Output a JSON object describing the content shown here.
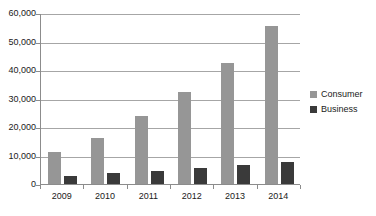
{
  "chart_data": {
    "type": "bar",
    "title": "",
    "subtitle": "",
    "xlabel": "",
    "ylabel": "",
    "categories": [
      "2009",
      "2010",
      "2011",
      "2012",
      "2013",
      "2014"
    ],
    "series": [
      {
        "name": "Consumer",
        "color": "#969696",
        "values": [
          11200,
          16200,
          23800,
          32300,
          42500,
          55500
        ]
      },
      {
        "name": "Business",
        "color": "#3a3a3a",
        "values": [
          2800,
          3900,
          4700,
          5500,
          6700,
          7900
        ]
      }
    ],
    "ylim": [
      0,
      60000
    ],
    "yticks": [
      0,
      10000,
      20000,
      30000,
      40000,
      50000,
      60000
    ],
    "ytick_labels": [
      "0",
      "10,000",
      "20,000",
      "30,000",
      "40,000",
      "50,000",
      "60,000"
    ],
    "grid": true,
    "grid_axis": "y",
    "legend_position": "right",
    "background_color": "#ffffff",
    "axis_color": "#8c8c8c",
    "gridline_color": "#a6a6a6",
    "text_color": "#1a1a1a"
  },
  "legend": {
    "entries": [
      {
        "label": "Consumer",
        "swatch": "legend-swatch-consumer"
      },
      {
        "label": "Business",
        "swatch": "legend-swatch-business"
      }
    ]
  }
}
